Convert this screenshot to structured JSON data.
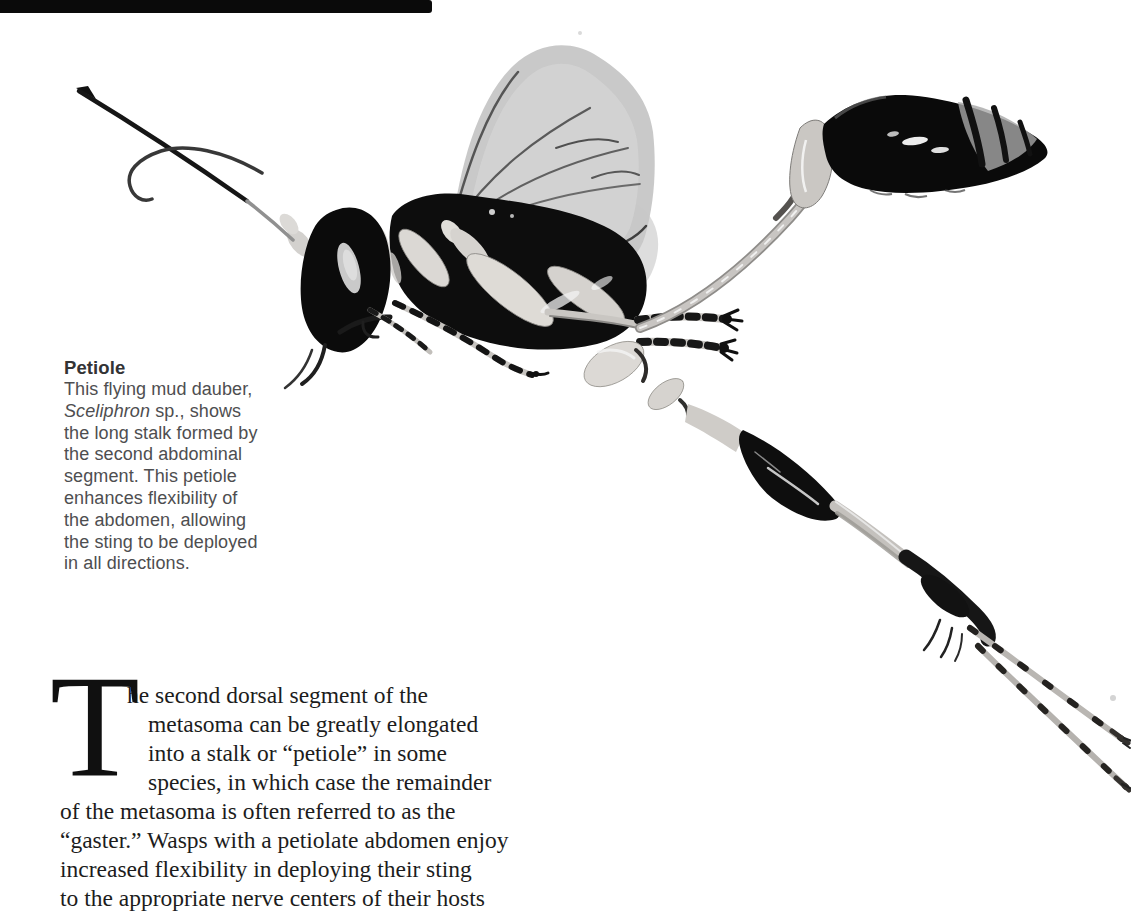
{
  "page": {
    "background": "#ffffff"
  },
  "figure": {
    "name": "mud-dauber-wasp-photograph",
    "style": "black-and-white studio photo on white background"
  },
  "caption": {
    "title": "Petiole",
    "species_italic": "Sceliphron",
    "species_rest": " sp., shows",
    "lines": [
      "This flying mud dauber,",
      "the long stalk formed by",
      "the second abdominal",
      "segment. This petiole",
      "enhances flexibility of",
      "the abdomen, allowing",
      "the sting to be deployed",
      "in all directions."
    ]
  },
  "body": {
    "dropcap": "T",
    "lines": [
      "he second dorsal segment of the",
      "metasoma can be greatly elongated",
      "into a stalk or “petiole” in some",
      "species, in which case the remainder",
      "of the metasoma is often referred to as the",
      "“gaster.” Wasps with a petiolate abdomen enjoy",
      "increased flexibility in deploying their sting",
      "to the appropriate nerve centers of their hosts",
      "or prey."
    ]
  },
  "colors": {
    "background": "#ffffff",
    "scan_bar": "#0a0a0a",
    "body_text": "#1c1c1c",
    "caption_text": "#4e4e50",
    "caption_title": "#333335",
    "wasp_black": "#0d0d0d",
    "wasp_pale_legs": "#d8d5d1",
    "wing_gray": "#c6c6c6"
  }
}
